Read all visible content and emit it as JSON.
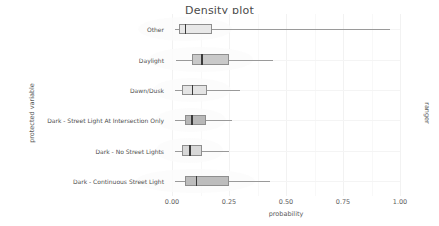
{
  "chart_data": {
    "type": "boxplot",
    "title": "Density plot",
    "xlabel": "probability",
    "ylabel": "protected variable",
    "right_label": "ranger",
    "xlim": [
      0.0,
      1.0
    ],
    "xticks": [
      "0.00",
      "0.25",
      "0.50",
      "0.75",
      "1.00"
    ],
    "xtick_values": [
      0.0,
      0.25,
      0.5,
      0.75,
      1.0
    ],
    "grid": true,
    "legend": "none",
    "categories": [
      "Other",
      "Daylight",
      "Dawn/Dusk",
      "Dark - Street Light At Intersection Only",
      "Dark - No Street Lights",
      "Dark - Continuous Street Light"
    ],
    "boxes": [
      {
        "label": "Other",
        "whisker_low": 0.015,
        "q1": 0.032,
        "median": 0.057,
        "q3": 0.175,
        "whisker_high": 0.955,
        "fill": "#e8e8e8"
      },
      {
        "label": "Daylight",
        "whisker_low": 0.018,
        "q1": 0.086,
        "median": 0.128,
        "q3": 0.248,
        "whisker_high": 0.445,
        "fill": "#c9c9c9"
      },
      {
        "label": "Dawn/Dusk",
        "whisker_low": 0.012,
        "q1": 0.046,
        "median": 0.086,
        "q3": 0.155,
        "whisker_high": 0.3,
        "fill": "#e4e4e4"
      },
      {
        "label": "Dark - Street Light At Intersection Only",
        "whisker_low": 0.015,
        "q1": 0.055,
        "median": 0.084,
        "q3": 0.147,
        "whisker_high": 0.262,
        "fill": "#b8b8b8"
      },
      {
        "label": "Dark - No Street Lights",
        "whisker_low": 0.012,
        "q1": 0.046,
        "median": 0.076,
        "q3": 0.133,
        "whisker_high": 0.25,
        "fill": "#d8d8d8"
      },
      {
        "label": "Dark - Continuous Street Light",
        "whisker_low": 0.014,
        "q1": 0.056,
        "median": 0.104,
        "q3": 0.25,
        "whisker_high": 0.43,
        "fill": "#bdbdbd"
      }
    ]
  },
  "colors": {
    "panel_background": "#ffffff",
    "grid": "#f2f2f2",
    "box_outline": "#8e8e8e",
    "median": "#3a3a3a",
    "whisker": "#9a9a9a",
    "text": "#4d4d4d"
  }
}
